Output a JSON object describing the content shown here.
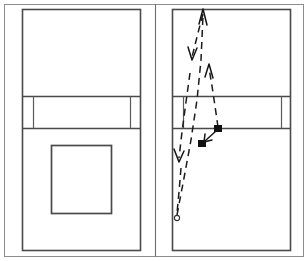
{
  "figure": {
    "background_color": "#ffffff",
    "line_color": "#4a4a4a",
    "trajectory_color": "#1b1b1b",
    "marker_color": "#111111",
    "width": 308,
    "height": 261
  },
  "outer_frame": {
    "x": 4,
    "y": 4,
    "width": 300,
    "height": 253
  },
  "panel_divider": {
    "x": 155,
    "y1": 4,
    "y2": 257
  },
  "panels": [
    {
      "id": "left-panel",
      "name": "court-plain",
      "court": {
        "x": 22,
        "y": 9,
        "width": 119,
        "height": 242
      },
      "net_band": {
        "y_top": 96,
        "y_bottom": 129
      },
      "band_left_divider_x": 33,
      "band_right_divider_x": 130,
      "zone_box": {
        "x": 51,
        "y": 145,
        "width": 60,
        "height": 68
      },
      "has_trajectory": false
    },
    {
      "id": "right-panel",
      "name": "court-with-trajectory",
      "court": {
        "x": 172,
        "y": 9,
        "width": 119,
        "height": 242
      },
      "net_band": {
        "y_top": 96,
        "y_bottom": 129
      },
      "band_left_divider_x": 183,
      "band_right_divider_x": 281,
      "has_trajectory": true
    }
  ],
  "trajectory": {
    "label": "dashed-flight-path",
    "segments": [
      {
        "id": "segment-up-right",
        "name": "rally-upward-leg",
        "points": "177,217 186,174 194,128 199,88 202,44 203,12",
        "arrowhead": {
          "at": "203,9",
          "direction": "up"
        }
      },
      {
        "id": "segment-down-left",
        "name": "rally-downward-leg",
        "points": "203,12 199,28 195,44 192,56"
      },
      {
        "id": "segment-up-mid",
        "name": "rally-upward-short-leg",
        "points": "209,67 213,92 216,115 218,128"
      },
      {
        "id": "segment-descend-left",
        "name": "rally-descending-leg",
        "points": "190,74 185,104 181,136 178,158"
      },
      {
        "id": "segment-tail",
        "name": "rally-tail-leg",
        "points": "180,170 179,192 178,212"
      }
    ],
    "arrows": [
      {
        "id": "arrow-top",
        "name": "arrowhead-up-top",
        "tip": "203,9",
        "direction": "up"
      },
      {
        "id": "arrow-upper-down",
        "name": "arrowhead-down-upper",
        "tip": "192,58",
        "direction": "down"
      },
      {
        "id": "arrow-mid-up",
        "name": "arrowhead-up-mid",
        "tip": "209,63",
        "direction": "up"
      },
      {
        "id": "arrow-left-down",
        "name": "arrowhead-down-left",
        "tip": "179,161",
        "direction": "down"
      },
      {
        "id": "arrow-to-marker",
        "name": "arrowhead-to-marker",
        "tip": "204,141",
        "direction": "down-left"
      }
    ],
    "markers": [
      {
        "id": "marker-contact-upper",
        "name": "marker-square-upper",
        "x": 218,
        "y": 129,
        "size": 7,
        "shape": "square"
      },
      {
        "id": "marker-contact-lower",
        "name": "marker-square-lower",
        "x": 202,
        "y": 143,
        "size": 7,
        "shape": "square"
      },
      {
        "id": "marker-origin",
        "name": "marker-circle-origin",
        "x": 177,
        "y": 218,
        "r": 2.6,
        "shape": "circle"
      }
    ],
    "connector": {
      "id": "marker-connector",
      "points": "216,131 206,140"
    }
  }
}
